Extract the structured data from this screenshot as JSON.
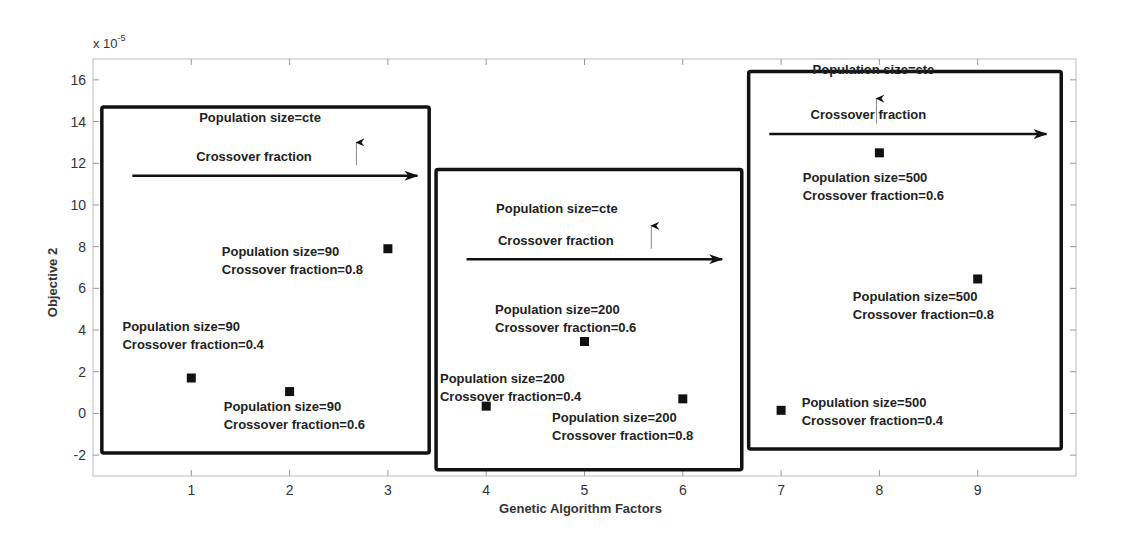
{
  "chart_data": {
    "type": "scatter",
    "title": "",
    "xlabel": "Genetic Algorithm Factors",
    "ylabel": "Objective 2",
    "y_scale_label": "x 10",
    "y_scale_exponent": "-5",
    "xlim": [
      0,
      10
    ],
    "ylim": [
      -3,
      17
    ],
    "xticks": [
      1,
      2,
      3,
      4,
      5,
      6,
      7,
      8,
      9
    ],
    "yticks": [
      -2,
      0,
      2,
      4,
      6,
      8,
      10,
      12,
      14,
      16
    ],
    "grid": false,
    "legend": null,
    "series": [
      {
        "name": "Objective 2",
        "marker": "square",
        "color": "#111111",
        "x": [
          1,
          2,
          3,
          4,
          5,
          6,
          7,
          8,
          9
        ],
        "y": [
          1.7,
          1.05,
          7.9,
          0.35,
          3.45,
          0.7,
          0.15,
          12.5,
          6.45
        ],
        "population_size": [
          90,
          90,
          90,
          200,
          200,
          200,
          500,
          500,
          500
        ],
        "crossover_fraction": [
          0.4,
          0.6,
          0.8,
          0.4,
          0.6,
          0.8,
          0.4,
          0.6,
          0.8
        ]
      }
    ],
    "groups": [
      {
        "box": {
          "x0": 0.09,
          "x1": 3.42,
          "y0": -1.9,
          "y1": 14.7
        },
        "header": "Population size=cte",
        "arrow_label": "Crossover fraction",
        "arrow": {
          "x0": 0.4,
          "x1": 3.3,
          "y": 11.4
        },
        "arrow_label_pos": {
          "x": 1.05,
          "y": 12.1
        },
        "header_pos": {
          "x": 1.08,
          "y": 14.0
        },
        "up_arrow": {
          "x": 2.68,
          "y0": 11.9,
          "y1": 13.0
        }
      },
      {
        "box": {
          "x0": 3.49,
          "x1": 6.6,
          "y0": -2.7,
          "y1": 11.7
        },
        "header": "Population size=cte",
        "arrow_label": "Crossover fraction",
        "arrow": {
          "x0": 3.8,
          "x1": 6.4,
          "y": 7.4
        },
        "arrow_label_pos": {
          "x": 4.12,
          "y": 8.1
        },
        "header_pos": {
          "x": 4.1,
          "y": 9.6
        },
        "up_arrow": {
          "x": 5.68,
          "y0": 7.9,
          "y1": 9.0
        }
      },
      {
        "box": {
          "x0": 6.67,
          "x1": 9.85,
          "y0": -1.7,
          "y1": 16.4
        },
        "header": "Population size=cte",
        "arrow_label": "Crossover fraction",
        "arrow": {
          "x0": 6.88,
          "x1": 9.7,
          "y": 13.4
        },
        "arrow_label_pos": {
          "x": 7.3,
          "y": 14.1
        },
        "header_pos": {
          "x": 7.32,
          "y": 16.3
        },
        "up_arrow": {
          "x": 7.97,
          "y0": 13.9,
          "y1": 15.1
        }
      }
    ],
    "annotations": [
      {
        "lines": [
          "Population size=90",
          "Crossover fraction=0.4"
        ],
        "x": 0.3,
        "y": 3.95
      },
      {
        "lines": [
          "Population size=90",
          "Crossover fraction=0.6"
        ],
        "x": 1.33,
        "y": 0.1
      },
      {
        "lines": [
          "Population size=90",
          "Crossover fraction=0.8"
        ],
        "x": 1.31,
        "y": 7.55
      },
      {
        "lines": [
          "Population size=200",
          "Crossover fraction=0.4"
        ],
        "x": 3.53,
        "y": 1.45
      },
      {
        "lines": [
          "Population size=200",
          "Crossover fraction=0.6"
        ],
        "x": 4.09,
        "y": 4.75
      },
      {
        "lines": [
          "Population size=200",
          "Crossover fraction=0.8"
        ],
        "x": 4.67,
        "y": -0.4
      },
      {
        "lines": [
          "Population size=500",
          "Crossover fraction=0.4"
        ],
        "x": 7.21,
        "y": 0.3
      },
      {
        "lines": [
          "Population size=500",
          "Crossover fraction=0.6"
        ],
        "x": 7.22,
        "y": 11.1
      },
      {
        "lines": [
          "Population size=500",
          "Crossover fraction=0.8"
        ],
        "x": 7.73,
        "y": 5.4
      }
    ]
  }
}
